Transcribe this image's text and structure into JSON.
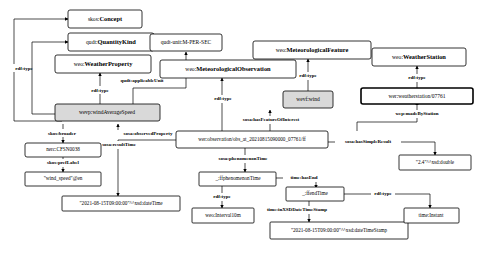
{
  "diagram": {
    "type": "rdf-knowledge-graph",
    "background_color": "#ffffff",
    "shaded_node_color": "#d9d9d9",
    "line_color": "#000000"
  },
  "nodes": {
    "skos_concept": {
      "prefix": "skos:",
      "local": "Concept",
      "full": "skos:Concept"
    },
    "qudt_quantitykind": {
      "prefix": "qudt:",
      "local": "QuantityKind",
      "full": "qudt:QuantityKind"
    },
    "weo_weatherproperty": {
      "prefix": "weo:",
      "local": "WeatherProperty",
      "full": "weo:WeatherProperty"
    },
    "qudt_unit_mpersec": {
      "prefix": "",
      "local": "",
      "full": "qudt-unit:M-PER-SEC"
    },
    "weo_metfeature": {
      "prefix": "weo:",
      "local": "MeteorologicalFeature",
      "full": "weo:MeteorologicalFeature"
    },
    "weo_weatherstation": {
      "prefix": "weo:",
      "local": "WeatherStation",
      "full": "weo:WeatherStation"
    },
    "weo_metobservation": {
      "prefix": "weo:",
      "local": "MeteorologicalObservation",
      "full": "weo:MeteorologicalObservation"
    },
    "wevp_windavgspeed": {
      "prefix": "",
      "local": "",
      "full": "wevp:windAverageSpeed"
    },
    "wevf_wind": {
      "prefix": "",
      "local": "",
      "full": "wevf:wind"
    },
    "wer_station": {
      "prefix": "",
      "local": "",
      "full": "wer:weatherstation/07761"
    },
    "wer_observation": {
      "prefix": "",
      "local": "",
      "full": "wer:observation/obs_at_20210815090000_07761/ff"
    },
    "nerc_cfsn0038": {
      "prefix": "",
      "local": "",
      "full": "nerc:CFSN0038"
    },
    "lit_windspeed_label": {
      "prefix": "",
      "local": "",
      "full": "\"wind_speed\"@en"
    },
    "lit_resulttime": {
      "prefix": "",
      "local": "",
      "full": "\"2021-08-15T09:00:00\"^^xsd:dateTime"
    },
    "bnode_phenomenontime": {
      "prefix": "",
      "local": "",
      "full": "_:ffphenomenonTime"
    },
    "weo_interval10m": {
      "prefix": "",
      "local": "",
      "full": "weo:Interval10m"
    },
    "bnode_endtime": {
      "prefix": "",
      "local": "",
      "full": "_:ffendTime"
    },
    "lit_endtime": {
      "prefix": "",
      "local": "",
      "full": "\"2021-08-15T09:00:00\"^^xsd:dateTimeStamp"
    },
    "time_instant": {
      "prefix": "",
      "local": "",
      "full": "time:Instant"
    },
    "lit_simpleresult": {
      "prefix": "",
      "local": "",
      "full": "\"2.4\"^^xsd:double"
    }
  },
  "edges": {
    "rdftype_1": {
      "label": "rdf:type"
    },
    "rdftype_2": {
      "label": "rdf:type"
    },
    "rdftype_3": {
      "label": "rdf:type"
    },
    "rdftype_4": {
      "label": "rdf:type"
    },
    "rdftype_5": {
      "label": "rdf:type"
    },
    "rdftype_6": {
      "label": "rdf:type"
    },
    "rdftype_7": {
      "label": "rdf:type"
    },
    "rdftype_8": {
      "label": "rdf:type"
    },
    "applicable_unit": {
      "label": "qudt:applicableUnit"
    },
    "skos_broader": {
      "label": "skos:broader"
    },
    "skos_preflabel": {
      "label": "skos:prefLabel"
    },
    "observed_property": {
      "label": "sosa:observedProperty"
    },
    "result_time": {
      "label": "sosa:resultTime"
    },
    "feature_of_interest": {
      "label": "sosa:hasFeatureOfInterest"
    },
    "made_by_station": {
      "label": "wep:madeByStation"
    },
    "simple_result": {
      "label": "sosa:hasSimpleResult"
    },
    "phenomenon_time": {
      "label": "sosa:phenomenonTime"
    },
    "has_end": {
      "label": "time:hasEnd"
    },
    "in_xsd_datetimestamp": {
      "label": "time:inXSDDateTimeStamp"
    }
  }
}
